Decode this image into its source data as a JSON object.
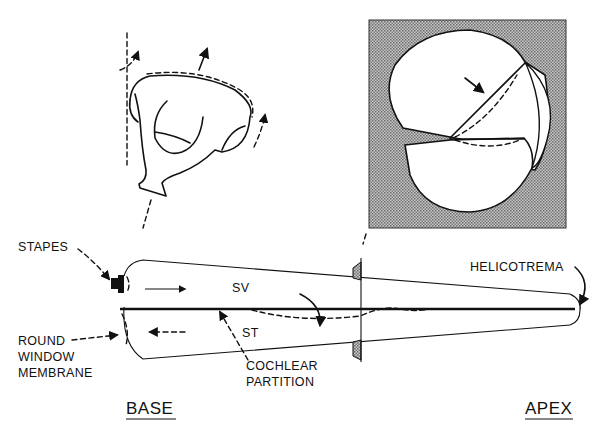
{
  "diagram": {
    "labels": {
      "stapes": "STAPES",
      "round_window": [
        "ROUND",
        "WINDOW",
        "MEMBRANE"
      ],
      "sv": "SV",
      "st": "ST",
      "cochlear_partition": [
        "COCHLEAR",
        "PARTITION"
      ],
      "helicotrema": "HELICOTREMA",
      "base": "BASE",
      "apex": "APEX"
    },
    "colors": {
      "ink": "#111111",
      "background": "#ffffff",
      "inset_fill": "#9a9a9a"
    },
    "elements": [
      "stapes-inset-drawing",
      "cross-section-inset",
      "uncoiled-cochlea-tube",
      "cochlear-partition-line",
      "traveling-wave-dashed"
    ]
  }
}
